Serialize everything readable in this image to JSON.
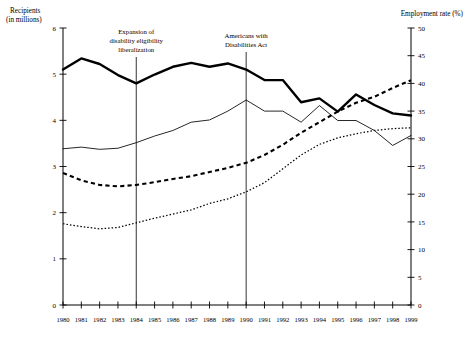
{
  "chart_data": {
    "type": "line",
    "title": "",
    "xlabel": "",
    "ylabel": "Recipients (in millions)",
    "y2label": "Employment rate (%)",
    "x": [
      1980,
      1981,
      1982,
      1983,
      1984,
      1985,
      1986,
      1987,
      1988,
      1989,
      1990,
      1991,
      1992,
      1993,
      1994,
      1995,
      1996,
      1997,
      1998,
      1999
    ],
    "xlim": [
      1980,
      1999
    ],
    "ylim": [
      0,
      6
    ],
    "y2lim": [
      0,
      50
    ],
    "yticks": [
      0,
      1,
      2,
      3,
      4,
      5,
      6
    ],
    "y2ticks": [
      0,
      5,
      10,
      15,
      20,
      25,
      30,
      35,
      40,
      45,
      50
    ],
    "xticklabels": [
      "1980",
      "1981",
      "1982",
      "1983",
      "1984",
      "1985",
      "1986",
      "1987",
      "1988",
      "1989",
      "1990",
      "1991",
      "1992",
      "1993",
      "1994",
      "1995",
      "1996",
      "1997",
      "1998",
      "1999"
    ],
    "grid": false,
    "legend_position": "bottom-right",
    "series": [
      {
        "name": "DI beneficiaries",
        "axis": "left",
        "style": "dashed-thick",
        "units": "millions",
        "values": [
          2.86,
          2.7,
          2.6,
          2.57,
          2.6,
          2.66,
          2.73,
          2.79,
          2.88,
          2.97,
          3.08,
          3.25,
          3.47,
          3.73,
          3.96,
          4.19,
          4.38,
          4.51,
          4.7,
          4.87
        ]
      },
      {
        "name": "SSI beneficiaries",
        "axis": "left",
        "style": "dotted-thin",
        "units": "millions",
        "values": [
          1.76,
          1.7,
          1.65,
          1.68,
          1.78,
          1.88,
          1.97,
          2.06,
          2.2,
          2.3,
          2.45,
          2.65,
          2.95,
          3.25,
          3.48,
          3.62,
          3.71,
          3.78,
          3.82,
          3.84
        ]
      },
      {
        "name": "Employment rate–men",
        "axis": "right",
        "style": "solid-thick",
        "units": "percent",
        "values": [
          42.5,
          44.5,
          43.5,
          41.5,
          40.0,
          41.6,
          43.0,
          43.7,
          43.0,
          43.6,
          42.5,
          40.6,
          40.6,
          36.6,
          37.3,
          34.9,
          38.0,
          36.1,
          34.6,
          34.2
        ]
      },
      {
        "name": "Employment rate–women",
        "axis": "right",
        "style": "solid-thin",
        "units": "percent",
        "values": [
          28.2,
          28.5,
          28.1,
          28.3,
          29.3,
          30.5,
          31.5,
          33.0,
          33.4,
          35.0,
          37.0,
          35.0,
          35.0,
          33.0,
          36.0,
          33.3,
          33.3,
          31.5,
          28.8,
          30.6
        ]
      }
    ],
    "annotations": [
      {
        "text_lines": [
          "Expansion of",
          "disability eligibility",
          "liberalization"
        ],
        "x_year": 1984
      },
      {
        "text_lines": [
          "Americans with",
          "Disabilities Act"
        ],
        "x_year": 1990
      }
    ]
  },
  "axes": {
    "left_title_line1": "Recipients",
    "left_title_line2": "(in millions)",
    "right_title": "Employment rate (%)"
  },
  "legend": {
    "left_scale_label": "Left scale",
    "right_scale_label": "Right scale",
    "entries": [
      {
        "label": "DI beneficiaries"
      },
      {
        "label": "SSI beneficiaries"
      },
      {
        "label": "Employment rate–men"
      },
      {
        "label": "Employment rate–women"
      }
    ]
  }
}
